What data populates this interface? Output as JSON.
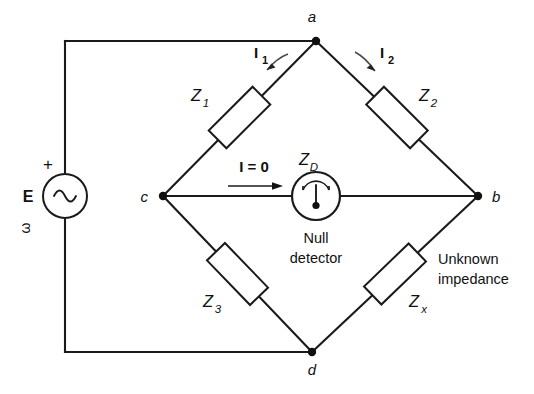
{
  "figure": {
    "background_color": "#ffffff",
    "line_color": "#1a1a1a"
  },
  "source": {
    "symbol_name": "ac-voltage-source",
    "label": "E",
    "polarity": "+",
    "frequency_label": "ω",
    "waveform": "sine"
  },
  "nodes": [
    {
      "id": "a",
      "label": "a"
    },
    {
      "id": "b",
      "label": "b"
    },
    {
      "id": "c",
      "label": "c"
    },
    {
      "id": "d",
      "label": "d"
    }
  ],
  "impedances": [
    {
      "id": "z1",
      "label": "Z",
      "subscript": "1",
      "branch": "a-c"
    },
    {
      "id": "z2",
      "label": "Z",
      "subscript": "2",
      "branch": "a-b"
    },
    {
      "id": "z3",
      "label": "Z",
      "subscript": "3",
      "branch": "c-d"
    },
    {
      "id": "zx",
      "label": "Z",
      "subscript": "x",
      "branch": "d-b",
      "note_line1": "Unknown",
      "note_line2": "impedance"
    }
  ],
  "detector": {
    "symbol_name": "null-detector-meter",
    "impedance_label": "Z",
    "impedance_subscript": "D",
    "name_line1": "Null",
    "name_line2": "detector"
  },
  "currents": [
    {
      "id": "i1",
      "label": "I",
      "subscript": "1",
      "direction": "a-to-c"
    },
    {
      "id": "i2",
      "label": "I",
      "subscript": "2",
      "direction": "a-to-b"
    },
    {
      "id": "i0",
      "label": "I = 0",
      "direction": "c-to-b"
    }
  ]
}
